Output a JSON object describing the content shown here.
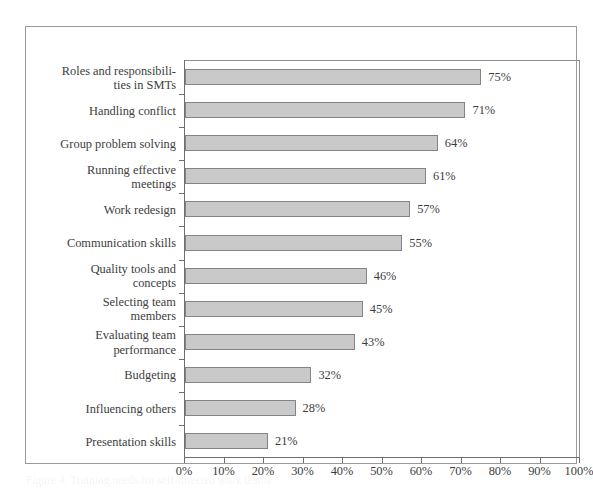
{
  "chart_data": {
    "type": "bar",
    "orientation": "horizontal",
    "title": "",
    "xlabel": "",
    "ylabel": "",
    "xlim": [
      0,
      100
    ],
    "xticks": [
      "0%",
      "10%",
      "20%",
      "30%",
      "40%",
      "50%",
      "60%",
      "70%",
      "80%",
      "90%",
      "100%"
    ],
    "xtick_values": [
      0,
      10,
      20,
      30,
      40,
      50,
      60,
      70,
      80,
      90,
      100
    ],
    "grid": false,
    "legend": "none",
    "value_suffix": "%",
    "categories": [
      "Roles and responsibili-\nties in SMTs",
      "Handling conflict",
      "Group problem solving",
      "Running effective\nmeetings",
      "Work redesign",
      "Communication skills",
      "Quality tools and\nconcepts",
      "Selecting team\nmembers",
      "Evaluating team\nperformance",
      "Budgeting",
      "Influencing others",
      "Presentation skills"
    ],
    "values": [
      75,
      71,
      64,
      61,
      57,
      55,
      46,
      45,
      43,
      32,
      28,
      21
    ],
    "value_labels": [
      "75%",
      "71%",
      "64%",
      "61%",
      "57%",
      "55%",
      "46%",
      "45%",
      "43%",
      "32%",
      "28%",
      "21%"
    ],
    "colors": {
      "bar_fill": "#c9c9c9",
      "bar_border": "#848484",
      "axis": "#6e6e6e",
      "frame": "#9a9a9a",
      "text": "#3d3d3d",
      "background": "#ffffff"
    }
  },
  "caption": {
    "ghost_text": "Figure 4. Training needs for self-directed work teams"
  }
}
